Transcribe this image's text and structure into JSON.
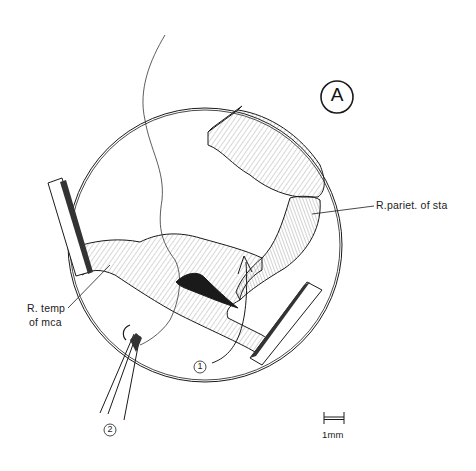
{
  "figure": {
    "panel_label": "A",
    "labels": {
      "parietal_branch": "R.pariet. of sta",
      "temporal_branch_line1": "R. temp",
      "temporal_branch_line2": "of mca"
    },
    "markers": {
      "step1": "1",
      "step2": "2"
    },
    "scale_bar": {
      "label": "1mm"
    },
    "colors": {
      "ink": "#1a1a1a",
      "background": "#ffffff",
      "hatch": "#555555"
    }
  }
}
